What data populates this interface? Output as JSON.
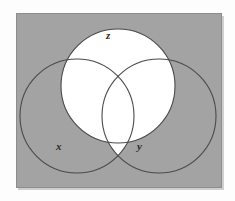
{
  "figure": {
    "type": "venn-diagram",
    "set_count": 3,
    "colors": {
      "page_background": "#fdfdfd",
      "frame_fill": "#a3a3a3",
      "frame_border": "#8d8d8d",
      "shaded_region": "#a3a3a3",
      "unshaded_region": "#ffffff",
      "circle_stroke": "#4a4a4a",
      "label_text": "#2b2b2b"
    },
    "frame": {
      "x": 16,
      "y": 13,
      "width": 206,
      "height": 175
    },
    "circles": [
      {
        "id": "x",
        "label": "x",
        "cx": 76,
        "cy": 115,
        "r": 57
      },
      {
        "id": "y",
        "label": "y",
        "cx": 158,
        "cy": 115,
        "r": 57
      },
      {
        "id": "z",
        "label": "z",
        "cx": 117,
        "cy": 85,
        "r": 57
      }
    ],
    "labels": [
      {
        "id": "z",
        "text": "z",
        "x": 106,
        "y": 30
      },
      {
        "id": "x",
        "text": "x",
        "x": 56,
        "y": 141
      },
      {
        "id": "y",
        "text": "y",
        "x": 137,
        "y": 141
      }
    ],
    "regions": [
      {
        "id": "x-only",
        "description": "x only",
        "shaded": true
      },
      {
        "id": "y-only",
        "description": "y only",
        "shaded": true
      },
      {
        "id": "z-only",
        "description": "z only",
        "shaded": false
      },
      {
        "id": "x-and-y-not-z",
        "description": "x and y, not z",
        "shaded": false
      },
      {
        "id": "x-and-z-not-y",
        "description": "x and z, not y",
        "shaded": false
      },
      {
        "id": "y-and-z-not-x",
        "description": "y and z, not x",
        "shaded": false
      },
      {
        "id": "x-and-y-and-z",
        "description": "x and y and z",
        "shaded": false
      },
      {
        "id": "outside-all",
        "description": "outside all circles",
        "shaded": true
      }
    ],
    "unshaded_expression": "z union (x intersect y)"
  }
}
